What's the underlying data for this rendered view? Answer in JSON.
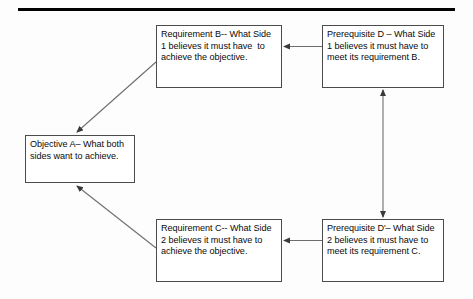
{
  "diagram": {
    "title_rule": "horizontal-rule",
    "nodes": [
      {
        "id": "requirement-b",
        "text": "Requirement B-- What Side 1 believes it must have  to achieve the objective."
      },
      {
        "id": "prerequisite-d",
        "text": "Prerequisite D – What Side 1 believes it must have to meet its requirement B."
      },
      {
        "id": "objective-a",
        "text": "Objective A– What both sides want to achieve."
      },
      {
        "id": "requirement-c",
        "text": "Requirement C-- What Side 2 believes it must have to achieve the objective."
      },
      {
        "id": "prerequisite-d-prime",
        "text": "Prerequisite D'– What Side 2 believes it must have to meet its requirement C."
      }
    ],
    "edges": [
      {
        "id": "edge-prereq-d-to-requirement-b",
        "from": "prerequisite-d",
        "to": "requirement-b",
        "direction": "left",
        "style": "single-arrow"
      },
      {
        "id": "edge-prereq-d-prime-to-requirement-c",
        "from": "prerequisite-d-prime",
        "to": "requirement-c",
        "direction": "left",
        "style": "single-arrow"
      },
      {
        "id": "edge-requirement-b-to-objective-a",
        "from": "requirement-b",
        "to": "objective-a",
        "direction": "down-left",
        "style": "single-arrow"
      },
      {
        "id": "edge-requirement-c-to-objective-a",
        "from": "requirement-c",
        "to": "objective-a",
        "direction": "up-left",
        "style": "single-arrow"
      },
      {
        "id": "edge-prereq-d-conflict-prereq-d-prime",
        "from": "prerequisite-d",
        "to": "prerequisite-d-prime",
        "direction": "vertical",
        "style": "double-arrow"
      }
    ],
    "colors": {
      "background": "#fdfdfd",
      "box_border": "#4b4b4b",
      "box_fill": "#ffffff",
      "text": "#0a0a0a",
      "connector": "#6e6e6e",
      "rule": "#000000"
    }
  }
}
